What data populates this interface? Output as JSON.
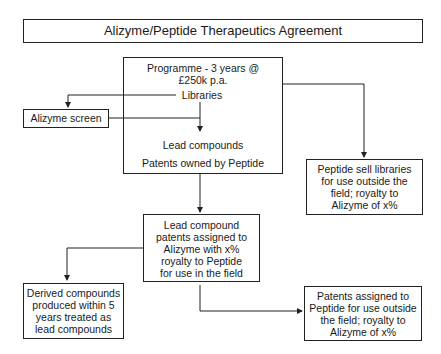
{
  "title": "Alizyme/Peptide Therapeutics Agreement",
  "nodes": {
    "programme": {
      "line1": "Programme - 3 years @",
      "line2": "£250k p.a."
    },
    "libraries": "Libraries",
    "alizyme_screen": "Alizyme screen",
    "lead_compounds": "Lead compounds",
    "patents_owned": "Patents owned by Peptide",
    "peptide_sell": [
      "Peptide sell libraries",
      "for use outside the",
      "field; royalty to",
      "Alizyme of x%"
    ],
    "lead_assigned": [
      "Lead compound",
      "patents assigned to",
      "Alizyme with x%",
      "royalty to Peptide",
      "for use in the field"
    ],
    "derived": [
      "Derived compounds",
      "produced within 5",
      "years treated as",
      "lead compounds"
    ],
    "patents_peptide": [
      "Patents assigned to",
      "Peptide for use outside",
      "the field; royalty to",
      "Alizyme of x%"
    ]
  }
}
